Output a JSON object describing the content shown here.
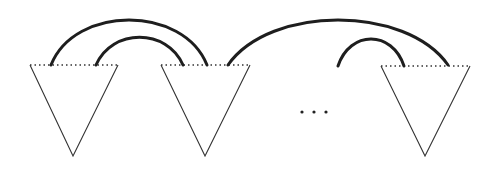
{
  "diagram": {
    "colors": {
      "line": "#333333",
      "arc": "#1e1e1e",
      "background": "#ffffff"
    },
    "triangles": [
      {
        "id": "triangle-1",
        "top_left": [
          30,
          65
        ],
        "top_right": [
          118,
          65
        ],
        "apex": [
          73,
          156
        ]
      },
      {
        "id": "triangle-2",
        "top_left": [
          161,
          65
        ],
        "top_right": [
          250,
          65
        ],
        "apex": [
          205,
          156
        ]
      },
      {
        "id": "triangle-n",
        "top_left": [
          381,
          66
        ],
        "top_right": [
          470,
          66
        ],
        "apex": [
          425,
          156
        ]
      }
    ],
    "arcs": [
      {
        "id": "arc-outer-1-2",
        "from": [
          51,
          65
        ],
        "to": [
          207,
          65
        ],
        "peak_y": 15
      },
      {
        "id": "arc-inner-1-2",
        "from": [
          96,
          65
        ],
        "to": [
          183,
          65
        ],
        "peak_y": 37
      },
      {
        "id": "arc-2-n",
        "from": [
          228,
          65
        ],
        "to": [
          448,
          65
        ],
        "peak_y": 15
      },
      {
        "id": "arc-incoming-n",
        "from": [
          338,
          66
        ],
        "to": [
          404,
          66
        ],
        "peak_y": 38
      }
    ],
    "ellipsis": {
      "label": "...",
      "dots": [
        [
          302,
          112
        ],
        [
          314,
          112
        ],
        [
          326,
          112
        ]
      ]
    }
  }
}
